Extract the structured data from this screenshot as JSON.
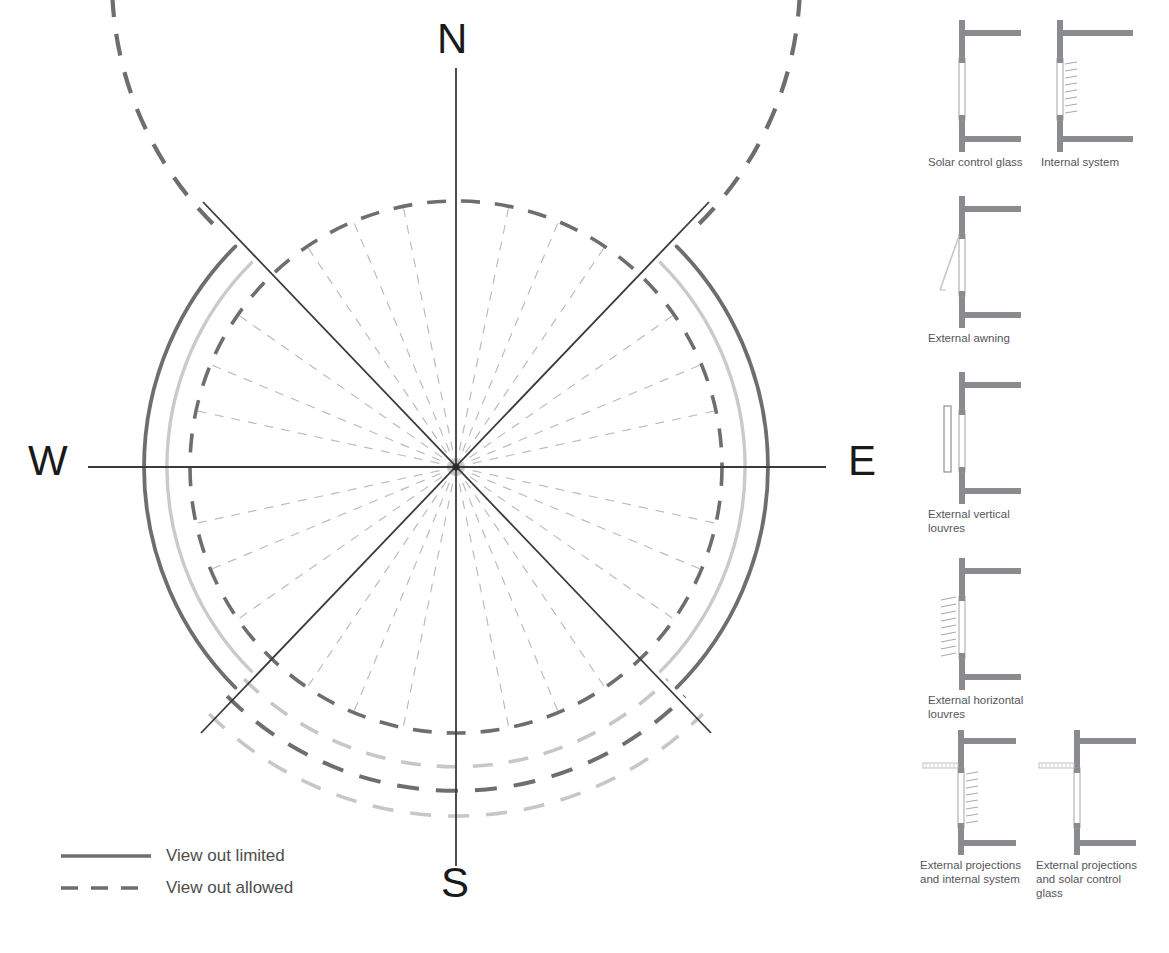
{
  "diagram": {
    "cardinals": {
      "north": "N",
      "south": "S",
      "east": "E",
      "west": "W"
    },
    "legend": [
      {
        "style": "solid",
        "label": "View out limited",
        "color": "#6d6e72"
      },
      {
        "style": "dashed",
        "label": "View out allowed",
        "color": "#6d6e72"
      }
    ],
    "colors": {
      "axis": "#3a3a3a",
      "dark_gray": "#6d6e72",
      "mid_gray": "#8f9094",
      "light_gray": "#c9cacc",
      "faint_gray": "#bcbdc0",
      "text": "#4d4d4d",
      "cardinal_text": "#1a1a1a",
      "wall_fill": "#8a8b8e",
      "glass": "#ffffff"
    },
    "geometry": {
      "center_x": 456,
      "center_y": 467,
      "inner_dashed_radius": 266,
      "light_solid_radius": 289,
      "dark_solid_radius": 312,
      "outer_dashed_radius": 344,
      "south_extra_radii": [
        300,
        324,
        349
      ],
      "radial_dashed_count": 16,
      "solid_axes_count": 8
    }
  },
  "details": [
    {
      "id": "solar-control-glass",
      "caption": "Solar control glass",
      "type": "glass-only",
      "col": 0,
      "row": 0
    },
    {
      "id": "internal-system",
      "caption": "Internal system",
      "type": "internal-blind",
      "col": 1,
      "row": 0
    },
    {
      "id": "external-awning",
      "caption": "External awning",
      "type": "awning",
      "col": 0,
      "row": 1
    },
    {
      "id": "external-vertical-louvres",
      "caption": "External vertical louvres",
      "type": "vertical-louvres",
      "col": 0,
      "row": 2
    },
    {
      "id": "external-horizontal-louvres",
      "caption": "External horizontal louvres",
      "type": "horizontal-louvres",
      "col": 0,
      "row": 3
    },
    {
      "id": "external-projections-and-internal-system",
      "caption": "External projections and internal system",
      "type": "projection-internal",
      "col": 0,
      "row": 4
    },
    {
      "id": "external-projections-and-solar-control-glass",
      "caption": "External projections and solar control glass",
      "type": "projection-glass",
      "col": 1,
      "row": 4
    }
  ]
}
